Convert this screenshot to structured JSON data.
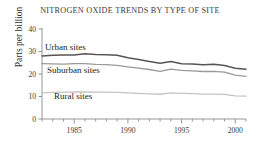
{
  "chart_data": {
    "type": "line",
    "title": "NITROGEN OXIDE TRENDS BY TYPE OF SITE",
    "xlabel": "",
    "ylabel": "Parts per billion",
    "ylim": [
      0,
      40
    ],
    "xlim": [
      1982,
      2001
    ],
    "yticks": [
      0,
      10,
      20,
      30,
      40
    ],
    "ytick_labels": [
      "0",
      "10",
      "20",
      "30",
      "40"
    ],
    "xticks": [
      1985,
      1990,
      1995,
      2000
    ],
    "xtick_labels": [
      "1985",
      "1990",
      "1995",
      "2000"
    ],
    "minor_xticks_every": 1,
    "grid": false,
    "legend_position": "inline-labels",
    "x": [
      1982,
      1983,
      1984,
      1985,
      1986,
      1987,
      1988,
      1989,
      1990,
      1991,
      1992,
      1993,
      1994,
      1995,
      1996,
      1997,
      1998,
      1999,
      2000,
      2001
    ],
    "series": [
      {
        "name": "Urban sites",
        "color": "#555555",
        "width": 1.5,
        "values": [
          28.0,
          28.3,
          28.5,
          28.4,
          29.0,
          28.7,
          28.6,
          28.3,
          27.2,
          26.4,
          25.6,
          24.8,
          25.6,
          24.6,
          24.4,
          24.1,
          24.3,
          23.8,
          22.6,
          22.1
        ]
      },
      {
        "name": "Suburban sites",
        "color": "#9a9a9a",
        "width": 1.3,
        "values": [
          24.6,
          24.5,
          24.4,
          24.6,
          24.6,
          24.3,
          24.2,
          23.8,
          23.2,
          22.6,
          22.0,
          21.2,
          22.2,
          21.6,
          21.4,
          21.1,
          21.2,
          20.8,
          19.5,
          18.9
        ]
      },
      {
        "name": "Rural sites",
        "color": "#c4c4c4",
        "width": 1.3,
        "values": [
          11.6,
          11.8,
          11.9,
          12.0,
          12.0,
          11.9,
          11.9,
          11.8,
          11.6,
          11.4,
          11.2,
          11.0,
          11.6,
          11.4,
          11.3,
          11.1,
          11.1,
          10.9,
          10.3,
          10.2
        ]
      }
    ]
  },
  "labels": {
    "urban": "Urban sites",
    "suburban": "Suburban sites",
    "rural": "Rural sites"
  }
}
